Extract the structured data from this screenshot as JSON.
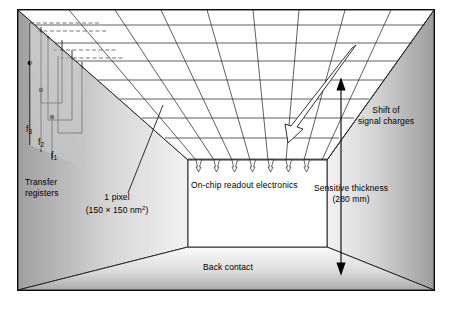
{
  "figure": {
    "kind": "ccd-detector-perspective-diagram",
    "border_color": "#000000",
    "background": "#ffffff"
  },
  "labels": {
    "phi3": "f",
    "phi3_sub": "3",
    "phi2": "f",
    "phi2_sub": "2",
    "phi1": "f",
    "phi1_sub": "1",
    "transfer_registers_line1": "Transfer",
    "transfer_registers_line2": "registers",
    "pixel_line1": "1 pixel",
    "pixel_line2_pre": "(150 × 150 nm",
    "pixel_line2_sup": "2",
    "pixel_line2_post": ")",
    "readout": "On-chip readout electronics",
    "shift_line1": "Shift of",
    "shift_line2": "signal charges",
    "thickness_line1": "Sensitive thickness",
    "thickness_line2": "(280 mm)",
    "back_contact": "Back contact"
  },
  "colors": {
    "line": "#1a1a1a",
    "dashed": "#555555",
    "wall_left_light": "#f2f2f2",
    "wall_left_dark": "#b9b9b9",
    "wall_right_light": "#c9c9c9",
    "wall_right_dark": "#f4f4f4",
    "floor_light": "#f6f6f6",
    "floor_dark": "#b5b5b5",
    "register_fill": "#d8d8d8",
    "readout_fill": "#ffffff",
    "node_fill": "#000000"
  },
  "geometry": {
    "frame": {
      "x": 17,
      "y": 9,
      "w": 418,
      "h": 282
    },
    "outer_corners": {
      "tl": [
        18,
        10
      ],
      "tr": [
        434,
        10
      ],
      "bl": [
        18,
        290
      ],
      "br": [
        434,
        290
      ]
    },
    "inner_box": {
      "tl": [
        188,
        160
      ],
      "tr": [
        327,
        160
      ],
      "bl": [
        188,
        247
      ],
      "br": [
        327,
        247
      ]
    },
    "ceiling_horizontal_lines": 8,
    "ceiling_vertical_lines": 9,
    "charge_arrows": 7,
    "register_phases": 3
  }
}
